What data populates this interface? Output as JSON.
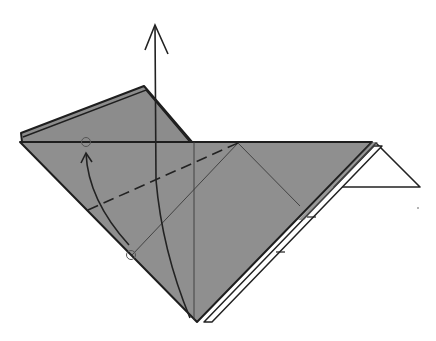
{
  "diagram": {
    "title": "Origami folding step",
    "colors": {
      "paper_colored": "#8f8f8f",
      "paper_white": "#ffffff",
      "line": "#222222",
      "thin_line": "#3a3a3a",
      "background": "#ffffff"
    },
    "elements": [
      {
        "id": "main-body",
        "kind": "colored-triangle"
      },
      {
        "id": "top-flap",
        "kind": "colored-flap"
      },
      {
        "id": "right-flap",
        "kind": "white-triangle"
      },
      {
        "id": "edge-strip",
        "kind": "white-edge-strip"
      },
      {
        "id": "valley-fold-line",
        "kind": "dashed-line"
      },
      {
        "id": "reference-line",
        "kind": "thin-crease"
      },
      {
        "id": "center-crease",
        "kind": "thin-crease"
      },
      {
        "id": "unfold-arrow",
        "kind": "arrow-up"
      },
      {
        "id": "fold-arrow",
        "kind": "curved-arrow"
      },
      {
        "id": "reference-point-top",
        "kind": "circle-marker"
      },
      {
        "id": "reference-point-bottom",
        "kind": "circle-marker"
      }
    ]
  }
}
